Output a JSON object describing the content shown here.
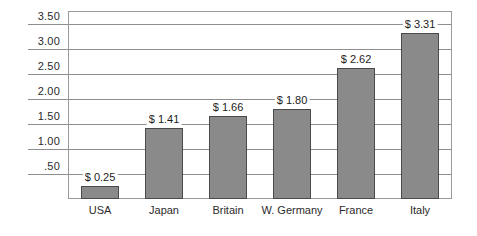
{
  "chart_data": {
    "type": "bar",
    "title": "",
    "subtitle": "",
    "xlabel": "",
    "ylabel": "",
    "categories": [
      "USA",
      "Japan",
      "Britain",
      "W. Germany",
      "France",
      "Italy"
    ],
    "values": [
      0.25,
      1.41,
      1.66,
      1.8,
      2.62,
      3.31
    ],
    "value_labels": [
      "$ 0.25",
      "$ 1.41",
      "$ 1.66",
      "$ 1.80",
      "$ 2.62",
      "$ 3.31"
    ],
    "ylim": [
      0,
      3.75
    ],
    "yticks": [
      3.5,
      3.0,
      2.5,
      2.0,
      1.5,
      1.0,
      0.5
    ],
    "ytick_labels": [
      "3.50",
      "3.00",
      "2.50",
      "2.00",
      "1.50",
      "1.00",
      ".50"
    ],
    "grid": true,
    "grid_axis": "y",
    "legend": "none",
    "bar_color": "#8a8a8a",
    "bar_edge_color": "#4a4a4a",
    "grid_color": "#8e8e8e",
    "frame_color": "#9a9a9a",
    "text_color": "#2b2b2b",
    "background": "#ffffff"
  }
}
